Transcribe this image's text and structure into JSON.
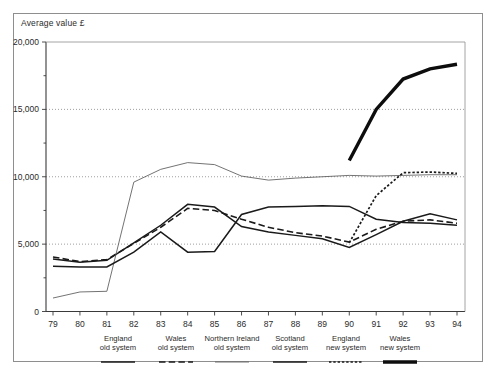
{
  "figure": {
    "axis_title": "Average value £",
    "frame_color": "#8e8e8e"
  },
  "legend": {
    "items": [
      {
        "label_line1": "England",
        "label_line2": "old system",
        "style": "solid-medium",
        "color": "#1a1a1a",
        "x": 118
      },
      {
        "label_line1": "Wales",
        "label_line2": "old system",
        "style": "dashed",
        "color": "#1a1a1a",
        "x": 176
      },
      {
        "label_line1": "Northern Ireland",
        "label_line2": "old system",
        "style": "solid-thin",
        "color": "#5a5a5a",
        "x": 232
      },
      {
        "label_line1": "Scotland",
        "label_line2": "old system",
        "style": "solid-medium",
        "color": "#1a1a1a",
        "x": 290
      },
      {
        "label_line1": "England",
        "label_line2": "new system",
        "style": "dotted",
        "color": "#1a1a1a",
        "x": 346
      },
      {
        "label_line1": "Wales",
        "label_line2": "new system",
        "style": "solid-thick",
        "color": "#0d0d0d",
        "x": 400
      }
    ]
  },
  "chart_data": {
    "type": "line",
    "title": "",
    "xlabel": "",
    "ylabel": "Average value £",
    "x": [
      79,
      80,
      81,
      82,
      83,
      84,
      85,
      86,
      87,
      88,
      89,
      90,
      91,
      92,
      93,
      94
    ],
    "xtick_labels": [
      "79",
      "80",
      "81",
      "82",
      "83",
      "84",
      "85",
      "86",
      "87",
      "88",
      "89",
      "90",
      "91",
      "92",
      "93",
      "94"
    ],
    "ytick_labels": [
      "0",
      "5,000",
      "10,000",
      "15,000",
      "20,000"
    ],
    "yticks": [
      0,
      5000,
      10000,
      15000,
      20000
    ],
    "yminorticks": [
      2500,
      7500,
      12500,
      17500
    ],
    "ylim": [
      0,
      20000
    ],
    "xlim": [
      79,
      94
    ],
    "grid": "horizontal-dotted",
    "legend_position": "below-axis",
    "series": [
      {
        "name": "England old system",
        "style": "solid-medium",
        "color": "#1a1a1a",
        "x": [
          79,
          80,
          81,
          82,
          83,
          84,
          85,
          86,
          87,
          88,
          89,
          90,
          91,
          92,
          93,
          94
        ],
        "values": [
          3900,
          3650,
          3800,
          5100,
          6400,
          7950,
          7750,
          6300,
          5900,
          5650,
          5400,
          4750,
          5700,
          6700,
          7250,
          6800
        ]
      },
      {
        "name": "Wales old system",
        "style": "dashed",
        "color": "#1a1a1a",
        "x": [
          79,
          80,
          81,
          82,
          83,
          84,
          85,
          86,
          87,
          88,
          89,
          90,
          91,
          92,
          93,
          94
        ],
        "values": [
          4050,
          3700,
          3850,
          5050,
          6250,
          7650,
          7500,
          6850,
          6250,
          5850,
          5600,
          5150,
          6100,
          6700,
          6800,
          6550
        ]
      },
      {
        "name": "Northern Ireland old system",
        "style": "solid-thin",
        "color": "#5a5a5a",
        "x": [
          79,
          80,
          81,
          82,
          83,
          84,
          85,
          86,
          87,
          88,
          89,
          90,
          91,
          92,
          93,
          94
        ],
        "values": [
          1000,
          1450,
          1500,
          9600,
          10550,
          11050,
          10900,
          10050,
          9750,
          9900,
          10000,
          10100,
          10050,
          10100,
          10150,
          10150
        ]
      },
      {
        "name": "Scotland old system",
        "style": "solid-medium",
        "color": "#1a1a1a",
        "x": [
          79,
          80,
          81,
          82,
          83,
          84,
          85,
          86,
          87,
          88,
          89,
          90,
          91,
          92,
          93,
          94
        ],
        "values": [
          3350,
          3300,
          3300,
          4400,
          5900,
          4400,
          4450,
          7200,
          7750,
          7800,
          7850,
          7800,
          6850,
          6600,
          6550,
          6400
        ]
      },
      {
        "name": "England new system",
        "style": "dotted",
        "color": "#1a1a1a",
        "x": [
          90,
          91,
          92,
          93,
          94
        ],
        "values": [
          5100,
          8600,
          10300,
          10350,
          10250
        ]
      },
      {
        "name": "Wales new system",
        "style": "solid-thick",
        "color": "#0d0d0d",
        "x": [
          90,
          91,
          92,
          93,
          94
        ],
        "values": [
          11200,
          15000,
          17250,
          18000,
          18350
        ]
      }
    ]
  }
}
